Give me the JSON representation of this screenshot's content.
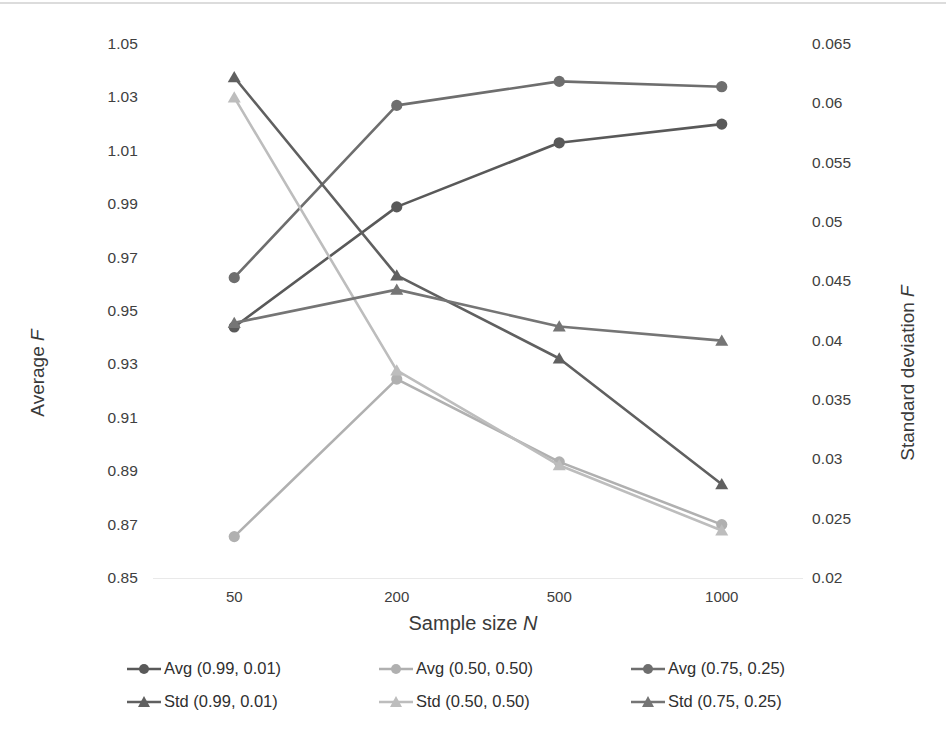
{
  "axes": {
    "x": {
      "label": "Sample size N",
      "label_plain": "Sample size",
      "label_italic": "N",
      "categories": [
        "50",
        "200",
        "500",
        "1000"
      ]
    },
    "y_left": {
      "label_plain": "Average",
      "label_italic": "F",
      "label": "Average F",
      "ticks": [
        "1.05",
        "1.03",
        "1.01",
        "0.99",
        "0.97",
        "0.95",
        "0.93",
        "0.91",
        "0.89",
        "0.87",
        "0.85"
      ],
      "min": 0.85,
      "max": 1.05,
      "step": 0.02
    },
    "y_right": {
      "label_plain": "Standard deviation",
      "label_italic": "F",
      "label": "Standard deviation F",
      "ticks": [
        "0.065",
        "0.06",
        "0.055",
        "0.05",
        "0.045",
        "0.04",
        "0.035",
        "0.03",
        "0.025",
        "0.02"
      ],
      "min": 0.02,
      "max": 0.065,
      "step": 0.005
    }
  },
  "legend": {
    "position": "bottom",
    "rows": [
      [
        {
          "label": "Avg (0.99, 0.01)",
          "marker": "circle",
          "color": "#595959",
          "series_key": "avg_99_01"
        },
        {
          "label": "Avg (0.50, 0.50)",
          "marker": "circle",
          "color": "#b0b0b0",
          "series_key": "avg_50_50"
        },
        {
          "label": "Avg (0.75, 0.25)",
          "marker": "circle",
          "color": "#6e6e6e",
          "series_key": "avg_75_25"
        }
      ],
      [
        {
          "label": "Std (0.99, 0.01)",
          "marker": "triangle",
          "color": "#606060",
          "series_key": "std_99_01"
        },
        {
          "label": "Std (0.50, 0.50)",
          "marker": "triangle",
          "color": "#bdbdbd",
          "series_key": "std_50_50"
        },
        {
          "label": "Std (0.75, 0.25)",
          "marker": "triangle",
          "color": "#757575",
          "series_key": "std_75_25"
        }
      ]
    ]
  },
  "chart_data": {
    "type": "line",
    "title": "",
    "xlabel": "Sample size N",
    "ylabel": "Average F",
    "y2label": "Standard deviation F",
    "categories": [
      "50",
      "200",
      "500",
      "1000"
    ],
    "x": [
      50,
      200,
      500,
      1000
    ],
    "ylim": [
      0.85,
      1.05
    ],
    "y2lim": [
      0.02,
      0.065
    ],
    "grid": false,
    "legend_position": "bottom",
    "series": [
      {
        "name": "Avg (0.99, 0.01)",
        "key": "avg_99_01",
        "axis": "left",
        "marker": "circle",
        "color": "#595959",
        "values": [
          0.944,
          0.989,
          1.013,
          1.02
        ]
      },
      {
        "name": "Avg (0.50, 0.50)",
        "key": "avg_50_50",
        "axis": "left",
        "marker": "circle",
        "color": "#b0b0b0",
        "values": [
          0.8655,
          0.9245,
          0.8935,
          0.87
        ]
      },
      {
        "name": "Avg (0.75, 0.25)",
        "key": "avg_75_25",
        "axis": "left",
        "marker": "circle",
        "color": "#6e6e6e",
        "values": [
          0.9625,
          1.027,
          1.036,
          1.034
        ]
      },
      {
        "name": "Std (0.99, 0.01)",
        "key": "std_99_01",
        "axis": "right",
        "marker": "triangle",
        "color": "#606060",
        "values": [
          0.0622,
          0.0455,
          0.0385,
          0.0279
        ]
      },
      {
        "name": "Std (0.50, 0.50)",
        "key": "std_50_50",
        "axis": "right",
        "marker": "triangle",
        "color": "#bdbdbd",
        "values": [
          0.0605,
          0.0375,
          0.0295,
          0.024
        ]
      },
      {
        "name": "Std (0.75, 0.25)",
        "key": "std_75_25",
        "axis": "right",
        "marker": "triangle",
        "color": "#757575",
        "values": [
          0.0415,
          0.0443,
          0.0412,
          0.04
        ]
      }
    ]
  }
}
